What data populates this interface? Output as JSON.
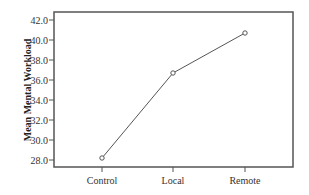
{
  "chart_data": {
    "type": "line",
    "title": "",
    "xlabel": "",
    "ylabel": "Mean Mental Workload",
    "categories": [
      "Control",
      "Local",
      "Remote"
    ],
    "series": [
      {
        "name": "Mean Mental Workload",
        "values": [
          28.2,
          36.7,
          40.7
        ],
        "marker": "open-circle",
        "color": "#555555"
      }
    ],
    "yticks": [
      "28.0",
      "30.0",
      "32.0",
      "34.0",
      "36.0",
      "38.0",
      "40.0",
      "42.0"
    ],
    "ytick_values": [
      28,
      30,
      32,
      34,
      36,
      38,
      40,
      42
    ],
    "ylim": [
      27.3,
      42.8
    ],
    "grid": false,
    "legend": null,
    "frame": "box"
  }
}
